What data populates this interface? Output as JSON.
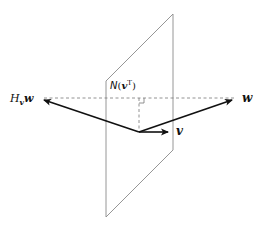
{
  "diagram": {
    "colors": {
      "plane": "#8a8a8a",
      "vector": "#111111",
      "dashed": "#777777",
      "background": "#ffffff"
    },
    "plane": {
      "label_main": "N",
      "label_open": "(",
      "label_vec": "v",
      "label_sup": "T",
      "label_close": ")",
      "vertices": [
        [
          106,
          81
        ],
        [
          173,
          14
        ],
        [
          173,
          150
        ],
        [
          106,
          217
        ]
      ]
    },
    "origin": [
      139,
      132
    ],
    "vectors": [
      {
        "name": "w",
        "label": "w",
        "to": [
          232,
          100
        ]
      },
      {
        "name": "v",
        "label": "v",
        "to": [
          168,
          132
        ]
      },
      {
        "name": "Hvw",
        "label_main": "H",
        "label_sub": "v",
        "label_vec": "w",
        "to": [
          44,
          100
        ]
      }
    ],
    "dashed_lines": [
      {
        "from": [
          44,
          98
        ],
        "to": [
          236,
          98
        ]
      },
      {
        "from": [
          139,
          98
        ],
        "to": [
          139,
          132
        ]
      }
    ],
    "right_angle_marker": {
      "x": 139,
      "y": 98,
      "size": 5
    }
  }
}
